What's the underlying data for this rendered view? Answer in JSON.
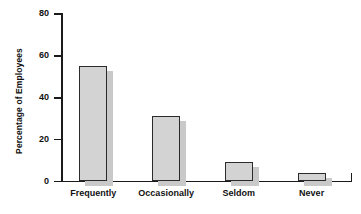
{
  "chart_data": {
    "type": "bar",
    "title": "",
    "xlabel": "",
    "ylabel": "Percentage of Employees",
    "categories": [
      "Frequently",
      "Occasionally",
      "Seldom",
      "Never"
    ],
    "values": [
      55,
      31,
      9,
      4
    ],
    "ylim": [
      0,
      80
    ],
    "yticks": [
      0,
      20,
      40,
      60,
      80
    ],
    "ytick_labels": [
      "0",
      "20",
      "40",
      "60",
      "80"
    ],
    "grid": false,
    "legend": false,
    "series": [
      {
        "name": "Percentage of Employees",
        "values": [
          55,
          31,
          9,
          4
        ]
      }
    ],
    "colors": {
      "bar_fill": "#d3d3d3",
      "bar_edge": "#2b2b2b",
      "bar_shadow": "#c9c9c9",
      "axis": "#1a1a1a",
      "text": "#111111",
      "background": "#ffffff"
    }
  }
}
